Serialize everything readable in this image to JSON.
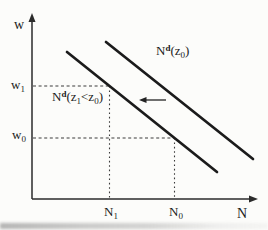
{
  "figure": {
    "axes": {
      "y_label": "w",
      "x_label": "N"
    },
    "point_labels": {
      "w1": {
        "base": "w",
        "sub": "1"
      },
      "w0": {
        "base": "w",
        "sub": "0"
      },
      "n1": {
        "base": "N",
        "sub": "1"
      },
      "n0": {
        "base": "N",
        "sub": "0"
      }
    },
    "curve_labels": {
      "right": {
        "base": "N",
        "sup": "d",
        "pre": "(z",
        "sub": "0",
        "post": ")"
      },
      "left": {
        "base": "N",
        "sup": "d",
        "pre": "(z",
        "sub_a": "1",
        "mid": "<z",
        "sub_b": "0",
        "post": ")"
      }
    },
    "colors": {
      "ink": "#1b1b1b",
      "axis": "#2b2b2b",
      "dash": "#3a3a3a",
      "background": "#fcfcfa"
    }
  },
  "chart_data": {
    "type": "line",
    "xlabel": "N",
    "ylabel": "w",
    "series": [
      {
        "name": "Nd(z0)",
        "role": "original-demand",
        "points_px": [
          [
            106,
            42
          ],
          [
            253,
            159
          ]
        ]
      },
      {
        "name": "Nd(z1<z0)",
        "role": "shifted-demand",
        "points_px": [
          [
            67,
            52
          ],
          [
            217,
            172
          ]
        ]
      }
    ],
    "guides": {
      "w1_y": 86,
      "w0_y": 138,
      "N1_x": 109.5,
      "N0_x": 174.5
    },
    "shift_arrow": {
      "from_x": 166,
      "to_x": 139,
      "y": 100,
      "direction": "left"
    },
    "axes_px": {
      "origin": [
        32,
        199
      ],
      "y_top": 13,
      "x_right": 258
    },
    "legend": "none",
    "grid": false
  }
}
